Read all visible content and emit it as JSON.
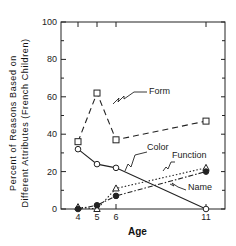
{
  "chart_data": {
    "type": "line",
    "title": "",
    "xlabel": "Age",
    "ylabel_line1": "Percent of Reasons Based on",
    "ylabel_line2": "Different Attributes (French Children)",
    "x": [
      4,
      5,
      6,
      11
    ],
    "xticks": [
      "4",
      "5",
      "6",
      "11"
    ],
    "yticks": [
      "0",
      "20",
      "40",
      "60",
      "80",
      "100"
    ],
    "ylim": [
      0,
      100
    ],
    "grid": false,
    "legend_position": "inline labels",
    "series": [
      {
        "name": "Form",
        "marker": "square-open",
        "line": "dashed",
        "values": [
          36,
          62,
          37,
          47
        ]
      },
      {
        "name": "Color",
        "marker": "circle-open",
        "line": "solid",
        "values": [
          32,
          24,
          22,
          0
        ]
      },
      {
        "name": "Function",
        "marker": "triangle-open",
        "line": "dotted",
        "values": [
          1,
          0,
          11,
          22
        ]
      },
      {
        "name": "Name",
        "marker": "circle-filled",
        "line": "dash-dot",
        "values": [
          0,
          2,
          7,
          20
        ]
      }
    ]
  }
}
